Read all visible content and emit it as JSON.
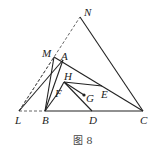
{
  "figure": {
    "caption": "图 8",
    "colors": {
      "stroke": "#222222",
      "dashed": "#555555",
      "background": "#ffffff"
    },
    "points": {
      "N": {
        "label": "N",
        "x": 80,
        "y": 17
      },
      "M": {
        "label": "M",
        "x": 54,
        "y": 57
      },
      "A": {
        "label": "A",
        "x": 63,
        "y": 60
      },
      "H": {
        "label": "H",
        "x": 64,
        "y": 82
      },
      "F": {
        "label": "F",
        "x": 58,
        "y": 93
      },
      "E": {
        "label": "E",
        "x": 102,
        "y": 86
      },
      "G": {
        "label": "G",
        "x": 84,
        "y": 95
      },
      "L": {
        "label": "L",
        "x": 19,
        "y": 111
      },
      "B": {
        "label": "B",
        "x": 45,
        "y": 111
      },
      "D": {
        "label": "D",
        "x": 92,
        "y": 111
      },
      "C": {
        "label": "C",
        "x": 143,
        "y": 111
      }
    },
    "solid_segments": [
      [
        "N",
        "C"
      ],
      [
        "N",
        "L"
      ],
      [
        "B",
        "C"
      ],
      [
        "M",
        "B"
      ],
      [
        "M",
        "C"
      ],
      [
        "A",
        "B"
      ],
      [
        "A",
        "L"
      ],
      [
        "H",
        "E"
      ],
      [
        "E",
        "C"
      ],
      [
        "H",
        "D"
      ],
      [
        "H",
        "G"
      ],
      [
        "H",
        "F"
      ]
    ],
    "dashed_segments": [
      [
        "L",
        "B"
      ],
      [
        "L",
        "N"
      ],
      [
        "L",
        "M"
      ]
    ]
  }
}
